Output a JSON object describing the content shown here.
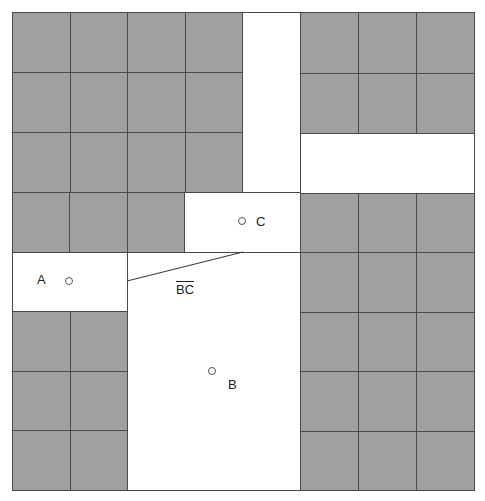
{
  "diagram": {
    "colors": {
      "grid_fill": "#a0a0a0",
      "grid_line": "#4a4a4a",
      "open_area": "#ffffff"
    },
    "outer_bounds": {
      "x": 12,
      "y": 12,
      "width": 462,
      "height": 478
    },
    "gray_blocks": [
      {
        "id": "top-left",
        "x": 12,
        "y": 12,
        "width": 230,
        "height": 180,
        "cols": 4,
        "rows": 3
      },
      {
        "id": "mid-left",
        "x": 12,
        "y": 192,
        "width": 172,
        "height": 60,
        "cols": 3,
        "rows": 1
      },
      {
        "id": "bottom-left",
        "x": 12,
        "y": 311,
        "width": 115,
        "height": 179,
        "cols": 2,
        "rows": 3
      },
      {
        "id": "top-right",
        "x": 300,
        "y": 12,
        "width": 174,
        "height": 121,
        "cols": 3,
        "rows": 2
      },
      {
        "id": "bottom-right",
        "x": 300,
        "y": 193,
        "width": 174,
        "height": 297,
        "cols": 3,
        "rows": 5
      }
    ],
    "white_regions": [
      {
        "id": "vertical-corridor",
        "x": 242,
        "y": 12,
        "width": 58,
        "height": 181
      },
      {
        "id": "right-band",
        "x": 300,
        "y": 133,
        "width": 174,
        "height": 60
      },
      {
        "id": "room-c",
        "x": 184,
        "y": 192,
        "width": 116,
        "height": 60
      },
      {
        "id": "room-a",
        "x": 12,
        "y": 252,
        "width": 115,
        "height": 59
      },
      {
        "id": "room-b",
        "x": 127,
        "y": 252,
        "width": 173,
        "height": 238
      }
    ],
    "points": [
      {
        "id": "A",
        "label": "A",
        "x": 69,
        "y": 281,
        "label_x": 37,
        "label_y": 273
      },
      {
        "id": "B",
        "label": "B",
        "x": 212,
        "y": 371,
        "label_x": 228,
        "label_y": 378
      },
      {
        "id": "C",
        "label": "C",
        "x": 242,
        "y": 221,
        "label_x": 256,
        "label_y": 215
      }
    ],
    "segment": {
      "label": "BC",
      "x1": 127,
      "y1": 281,
      "x2": 243,
      "y2": 252,
      "label_x": 176,
      "label_y": 283
    }
  }
}
